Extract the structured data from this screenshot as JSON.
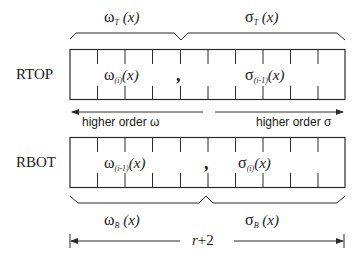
{
  "diagram": {
    "type": "register layout diagram",
    "register_top": {
      "label": "RTOP",
      "left_content": {
        "symbol": "ω",
        "subscript": "(i)",
        "arg": "(x)"
      },
      "separator": ",",
      "right_content": {
        "symbol": "σ",
        "subscript": "(i-1)",
        "arg": "(x)"
      },
      "cells": 10
    },
    "register_bottom": {
      "label": "RBOT",
      "left_content": {
        "symbol": "ω",
        "subscript": "(i-1)",
        "arg": "(x)"
      },
      "separator": ",",
      "right_content": {
        "symbol": "σ",
        "subscript": "(i)",
        "arg": "(x)"
      },
      "cells": 10
    },
    "top_braces": {
      "left": {
        "symbol": "ω",
        "subscript": "T",
        "arg": " (x)"
      },
      "right": {
        "symbol": "σ",
        "subscript": "T",
        "arg": " (x)"
      }
    },
    "bottom_braces": {
      "left": {
        "symbol": "ω",
        "subscript": "B",
        "arg": " (x)"
      },
      "right": {
        "symbol": "σ",
        "subscript": "B",
        "arg": " (x)"
      }
    },
    "arrows": {
      "left_label": "higher order ω",
      "right_label": "higher order σ"
    },
    "width_dimension": {
      "label_var": "r",
      "label_rest": "+2"
    },
    "colors": {
      "line": "#2a2a2a",
      "text": "#1a1a1a",
      "background": "#ffffff"
    }
  }
}
